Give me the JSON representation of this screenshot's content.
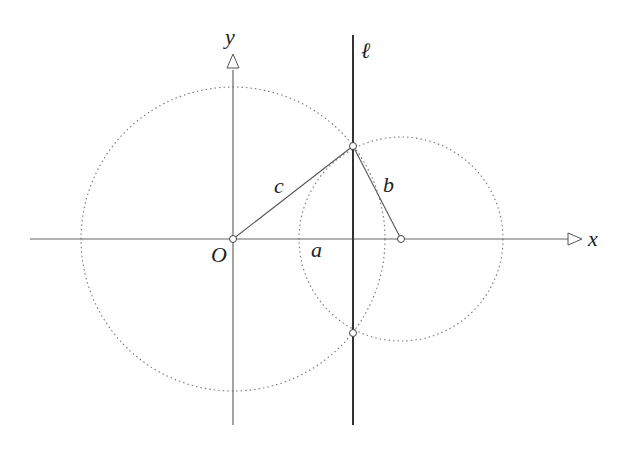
{
  "diagram": {
    "labels": {
      "y_axis": "y",
      "x_axis": "x",
      "line": "ℓ",
      "origin": "O",
      "side_a": "a",
      "side_b": "b",
      "side_c": "c"
    },
    "colors": {
      "axis": "#555555",
      "line_l": "#333333",
      "circle": "#777777",
      "segment": "#555555"
    },
    "geometry": {
      "origin_px": [
        233,
        239
      ],
      "big_circle": {
        "center": "O",
        "radius_px": 152
      },
      "small_circle": {
        "center": "(a+?,0)",
        "radius_px": 102
      },
      "line_l_x_px": 353,
      "intersection_points_px": [
        [
          353,
          146
        ],
        [
          353,
          333
        ]
      ],
      "point_on_x_axis_px": [
        401,
        239
      ]
    }
  }
}
